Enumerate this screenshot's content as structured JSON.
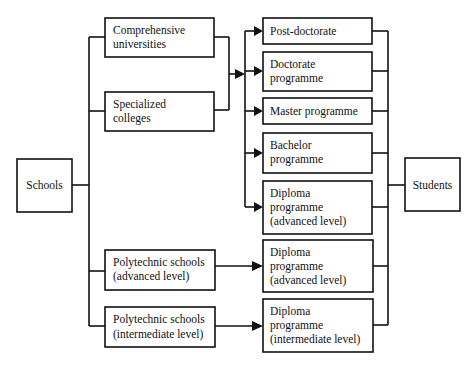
{
  "diagram": {
    "colors": {
      "stroke": "#111111",
      "background": "#ffffff"
    },
    "source": {
      "label": "Schools"
    },
    "target": {
      "label": "Students"
    },
    "institutions": [
      {
        "id": "comprehensive",
        "lines": [
          "Comprehensive",
          "universities"
        ]
      },
      {
        "id": "specialized",
        "lines": [
          "Specialized",
          "colleges"
        ]
      },
      {
        "id": "poly-advanced",
        "lines": [
          "Polytechnic schools",
          "(advanced level)"
        ]
      },
      {
        "id": "poly-intermediate",
        "lines": [
          "Polytechnic schools",
          "(intermediate level)"
        ]
      }
    ],
    "programmes": [
      {
        "id": "post-doctorate",
        "lines": [
          "Post-doctorate"
        ]
      },
      {
        "id": "doctorate",
        "lines": [
          "Doctorate",
          "programme"
        ]
      },
      {
        "id": "master",
        "lines": [
          "Master programme"
        ]
      },
      {
        "id": "bachelor",
        "lines": [
          "Bachelor",
          "programme"
        ]
      },
      {
        "id": "diploma-advanced-univ",
        "lines": [
          "Diploma",
          "programme",
          "(advanced level)"
        ]
      },
      {
        "id": "diploma-advanced-poly",
        "lines": [
          "Diploma",
          "programme",
          "(advanced level)"
        ]
      },
      {
        "id": "diploma-intermediate-poly",
        "lines": [
          "Diploma",
          "programme",
          "(intermediate level)"
        ]
      }
    ],
    "edges": [
      {
        "from": "Schools",
        "to": "Comprehensive universities"
      },
      {
        "from": "Schools",
        "to": "Specialized colleges"
      },
      {
        "from": "Schools",
        "to": "Polytechnic schools (advanced level)"
      },
      {
        "from": "Schools",
        "to": "Polytechnic schools (intermediate level)"
      },
      {
        "from": "Comprehensive universities + Specialized colleges",
        "to": "Post-doctorate"
      },
      {
        "from": "Comprehensive universities + Specialized colleges",
        "to": "Doctorate programme"
      },
      {
        "from": "Comprehensive universities + Specialized colleges",
        "to": "Master programme"
      },
      {
        "from": "Comprehensive universities + Specialized colleges",
        "to": "Bachelor programme"
      },
      {
        "from": "Comprehensive universities + Specialized colleges",
        "to": "Diploma programme (advanced level)"
      },
      {
        "from": "Polytechnic schools (advanced level)",
        "to": "Diploma programme (advanced level)"
      },
      {
        "from": "Polytechnic schools (intermediate level)",
        "to": "Diploma programme (intermediate level)"
      },
      {
        "from": "All programmes",
        "to": "Students"
      }
    ]
  }
}
